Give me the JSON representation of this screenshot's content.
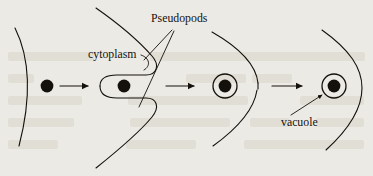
{
  "figure": {
    "background_color": "#eceae4",
    "ink_color": "#14110d"
  },
  "labels": {
    "pseudopods": "Pseudopods",
    "cytoplasm": "cytoplasm",
    "vacuole": "vacuole"
  },
  "stages": [
    {
      "name": "stage-1-contact",
      "description": "Cell membrane arc with food particle outside"
    },
    {
      "name": "stage-2-pseudopods",
      "description": "Pseudopods extend around the particle forming a pocket"
    },
    {
      "name": "stage-3-enclosed",
      "description": "Membrane closes, particle enclosed in vacuole"
    },
    {
      "name": "stage-4-vacuole",
      "description": "Food vacuole fully formed inside the cell"
    }
  ],
  "arrows": [
    {
      "name": "arrow-1",
      "from": "stage-1-contact",
      "to": "stage-2-pseudopods"
    },
    {
      "name": "arrow-2",
      "from": "stage-2-pseudopods",
      "to": "stage-3-enclosed"
    },
    {
      "name": "arrow-3",
      "from": "stage-3-enclosed",
      "to": "stage-4-vacuole"
    }
  ]
}
